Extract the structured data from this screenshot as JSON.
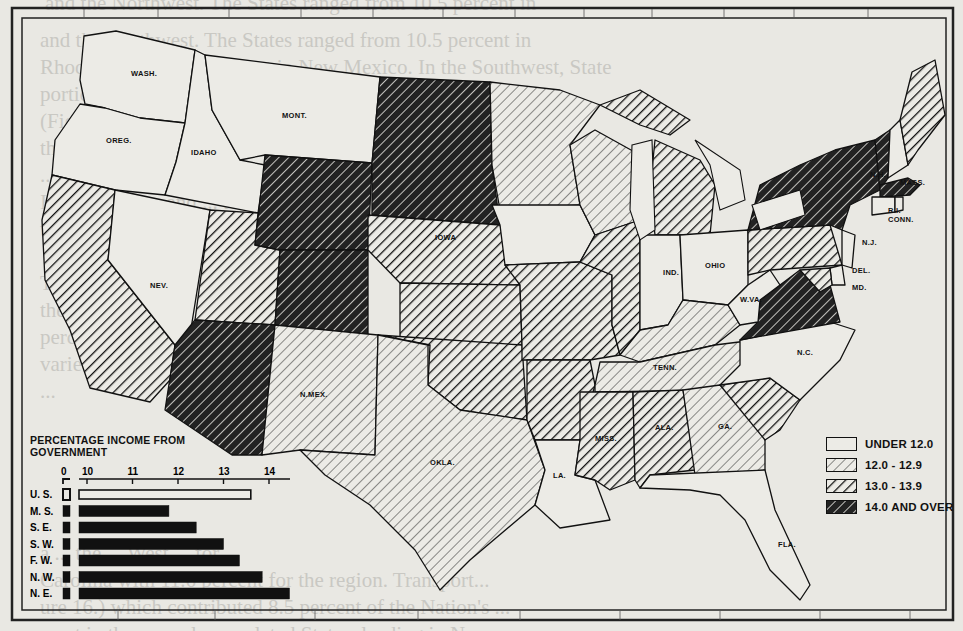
{
  "page": {
    "bleed_text_lines": [
      "and the Northwest. The States ranged from 10.5 percent in",
      "Rhode Island to 2.4 percent in New Mexico. In the Southwest, State",
      "portions ranged from ... in North Carolina to 0.8 percent in",
      "(Figure ...) ... ties, trade and transport",
      "the Nation ... ranging from over",
      "... percent ... percent ...",
      "In the ... the ... and ... tes",
      "to the ... ",
      "The ... the ... percent ...",
      "the Nation ... ",
      "percent ... least",
      "varied from ... rolina. The",
      "... ",
      "a ... the ... West ... for",
      "Carolina with 11.6 percent for the region. Transport...",
      "ure 16.) which contributed 8.5 percent of the Nation's ...",
      "most in the sparsely populated States, leading in New ..."
    ]
  },
  "map": {
    "states": [
      {
        "id": "WA",
        "label": "WASH.",
        "category": "under_12"
      },
      {
        "id": "OR",
        "label": "OREG.",
        "category": "under_12"
      },
      {
        "id": "ID",
        "label": "IDAHO",
        "category": "under_12"
      },
      {
        "id": "MT",
        "label": "MONT.",
        "category": "under_12"
      },
      {
        "id": "CA",
        "label": "CALIF.",
        "category": "13_to_13_9"
      },
      {
        "id": "NV",
        "label": "NEV.",
        "category": "under_12"
      },
      {
        "id": "UT",
        "label": "UTAH",
        "category": "13_to_13_9"
      },
      {
        "id": "WY",
        "label": "WYO.",
        "category": "14_and_over"
      },
      {
        "id": "CO",
        "label": "COLO.",
        "category": "14_and_over"
      },
      {
        "id": "AZ",
        "label": "ARIZ.",
        "category": "14_and_over"
      },
      {
        "id": "NM",
        "label": "N.MEX.",
        "category": "12_to_12_9"
      },
      {
        "id": "DAK",
        "label": "N.DAK.",
        "category": "14_and_over"
      },
      {
        "id": "NE",
        "label": "NEBR.",
        "category": "13_to_13_9"
      },
      {
        "id": "KS",
        "label": "KANS.",
        "category": "13_to_13_9"
      },
      {
        "id": "OK",
        "label": "OKLA.",
        "category": "13_to_13_9"
      },
      {
        "id": "TX",
        "label": "TEXAS",
        "category": "12_to_12_9"
      },
      {
        "id": "MN",
        "label": "MINN.",
        "category": "12_to_12_9"
      },
      {
        "id": "IA",
        "label": "IOWA",
        "category": "under_12"
      },
      {
        "id": "MO",
        "label": "MO.",
        "category": "13_to_13_9"
      },
      {
        "id": "AR",
        "label": "ARK.",
        "category": "13_to_13_9"
      },
      {
        "id": "LA",
        "label": "LA.",
        "category": "under_12"
      },
      {
        "id": "WI",
        "label": "WIS.",
        "category": "12_to_12_9"
      },
      {
        "id": "IL",
        "label": "ILL.",
        "category": "13_to_13_9"
      },
      {
        "id": "MI",
        "label": "MICH.",
        "category": "13_to_13_9"
      },
      {
        "id": "IN",
        "label": "IND.",
        "category": "under_12"
      },
      {
        "id": "OH",
        "label": "OHIO",
        "category": "under_12"
      },
      {
        "id": "KY",
        "label": "KY.",
        "category": "12_to_12_9"
      },
      {
        "id": "TN",
        "label": "TENN.",
        "category": "12_to_12_9"
      },
      {
        "id": "MS",
        "label": "MISS.",
        "category": "13_to_13_9"
      },
      {
        "id": "AL",
        "label": "ALA.",
        "category": "13_to_13_9"
      },
      {
        "id": "GA",
        "label": "GA.",
        "category": "12_to_12_9"
      },
      {
        "id": "FL",
        "label": "FLA.",
        "category": "under_12"
      },
      {
        "id": "SC",
        "label": "S.C.",
        "category": "13_to_13_9"
      },
      {
        "id": "NC",
        "label": "N.C.",
        "category": "under_12"
      },
      {
        "id": "VA",
        "label": "VA.",
        "category": "14_and_over"
      },
      {
        "id": "WV",
        "label": "W.VA.",
        "category": "under_12"
      },
      {
        "id": "PA",
        "label": "PA.",
        "category": "13_to_13_9"
      },
      {
        "id": "NY",
        "label": "N.Y.",
        "category": "14_and_over"
      },
      {
        "id": "NJ",
        "label": "N.J.",
        "category": "under_12"
      },
      {
        "id": "DE",
        "label": "DEL.",
        "category": "under_12"
      },
      {
        "id": "MD",
        "label": "MD.",
        "category": "13_to_13_9"
      },
      {
        "id": "ME",
        "label": "ME.",
        "category": "13_to_13_9"
      },
      {
        "id": "NH",
        "label": "N.H.",
        "category": "under_12"
      },
      {
        "id": "VT",
        "label": "VT.",
        "category": "14_and_over"
      },
      {
        "id": "MA",
        "label": "MASS.",
        "category": "14_and_over"
      },
      {
        "id": "RI",
        "label": "R.I.",
        "category": "under_12"
      },
      {
        "id": "CT",
        "label": "CONN.",
        "category": "under_12"
      }
    ],
    "legend": [
      {
        "key": "under_12",
        "label": "UNDER 12.0"
      },
      {
        "key": "12_to_12_9",
        "label": "12.0 - 12.9"
      },
      {
        "key": "13_to_13_9",
        "label": "13.0 - 13.9"
      },
      {
        "key": "14_and_over",
        "label": "14.0 AND OVER"
      }
    ]
  },
  "chart_data": {
    "type": "bar",
    "orientation": "horizontal",
    "title": "PERCENTAGE INCOME FROM GOVERNMENT",
    "categories": [
      "U. S.",
      "M. S.",
      "S. E.",
      "S. W.",
      "F. W.",
      "N. W.",
      "N. E."
    ],
    "values": [
      13.6,
      11.8,
      12.4,
      13.0,
      13.35,
      13.85,
      14.45
    ],
    "highlight": {
      "U. S.": "outline"
    },
    "xlabel": "",
    "ylabel": "",
    "xticks": [
      "0",
      "10",
      "11",
      "12",
      "13",
      "14"
    ],
    "xlim": [
      10,
      14.5
    ],
    "axis_break": "0 to 10 broken",
    "grid": false,
    "legend_position": "none"
  }
}
